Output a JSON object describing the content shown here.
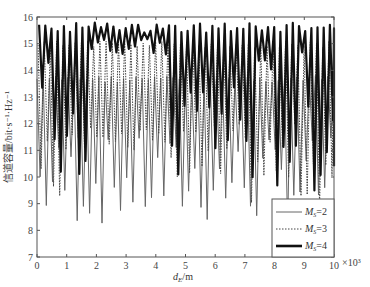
{
  "chart_data": {
    "type": "line",
    "title": "",
    "xlabel": "d_E/m",
    "xlabel_main": "d",
    "xlabel_sub": "E",
    "xlabel_unit": "/m",
    "x_multiplier": "×10³",
    "ylabel": "信道容量/bit·s⁻¹·Hz⁻¹",
    "xlim": [
      0,
      10
    ],
    "ylim": [
      7,
      16
    ],
    "xticks": [
      0,
      1,
      2,
      3,
      4,
      5,
      6,
      7,
      8,
      9,
      10
    ],
    "yticks": [
      7,
      8,
      9,
      10,
      11,
      12,
      13,
      14,
      15,
      16
    ],
    "grid": false,
    "legend_position": "lower right",
    "series": [
      {
        "name": "M_S=2",
        "label_main": "M",
        "label_sub": "S",
        "label_rest": "=2",
        "style": "solid-gray",
        "color": "#666666",
        "max": 13.8,
        "min_range": [
          8.1,
          11.5
        ],
        "oscillation_count": 48
      },
      {
        "name": "M_S=3",
        "label_main": "M",
        "label_sub": "S",
        "label_rest": "=3",
        "style": "dotted",
        "color": "#444444",
        "max": 15.1,
        "min_range": [
          8.8,
          12.0
        ],
        "oscillation_count": 48
      },
      {
        "name": "M_S=4",
        "label_main": "M",
        "label_sub": "S",
        "label_rest": "=4",
        "style": "solid-thick",
        "color": "#111111",
        "max": 15.8,
        "min_range": [
          9.2,
          14.8
        ],
        "oscillation_count": 48
      }
    ]
  }
}
